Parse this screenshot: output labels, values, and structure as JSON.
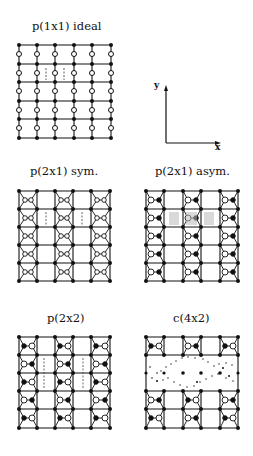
{
  "figure": {
    "panels": [
      {
        "id": "p1x1",
        "title": "p(1x1) ideal"
      },
      {
        "id": "p2x1sym",
        "title": "p(2x1) sym."
      },
      {
        "id": "p2x1asym",
        "title": "p(2x1) asym."
      },
      {
        "id": "p2x2",
        "title": "p(2x2)"
      },
      {
        "id": "c4x2",
        "title": "c(4x2)"
      }
    ],
    "axes": {
      "x_label": "x",
      "y_label": "y"
    },
    "colors": {
      "ink": "#111111",
      "background": "#ffffff"
    }
  }
}
